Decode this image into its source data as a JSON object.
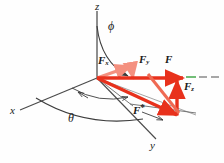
{
  "figure": {
    "background_color": "#fefefe"
  },
  "colors": {
    "vector_red": "#e8311c",
    "vector_light_red": "#f4907f",
    "axis_gray": "#4a4a4a",
    "arc_gray": "#3c3c3c",
    "dash_gray": "#8a8a8a",
    "dash_green": "#4fae55",
    "label_black": "#1a1a1a"
  },
  "axes": [
    {
      "name": "z-axis",
      "label": "z",
      "x": 95,
      "y": 2
    },
    {
      "name": "x-axis",
      "label": "x",
      "x": 11,
      "y": 112
    },
    {
      "name": "y-axis",
      "label": "y",
      "x": 151,
      "y": 144
    }
  ],
  "angles": [
    {
      "name": "phi",
      "label": "ϕ",
      "x": 109,
      "y": 22
    },
    {
      "name": "theta",
      "label": "θ",
      "x": 70,
      "y": 115
    }
  ],
  "vectors": [
    {
      "name": "F-x-component",
      "base": "F",
      "sub": "x",
      "x": 99,
      "y": 58
    },
    {
      "name": "F-y-component",
      "base": "F",
      "sub": "y",
      "x": 140,
      "y": 57
    },
    {
      "name": "F-resultant",
      "base": "F",
      "sub": "",
      "x": 165,
      "y": 57
    },
    {
      "name": "F-z-component",
      "base": "F",
      "sub": "z",
      "x": 184,
      "y": 83
    },
    {
      "name": "F-projection",
      "base": "F",
      "sub": "*",
      "x": 135,
      "y": 107
    }
  ]
}
